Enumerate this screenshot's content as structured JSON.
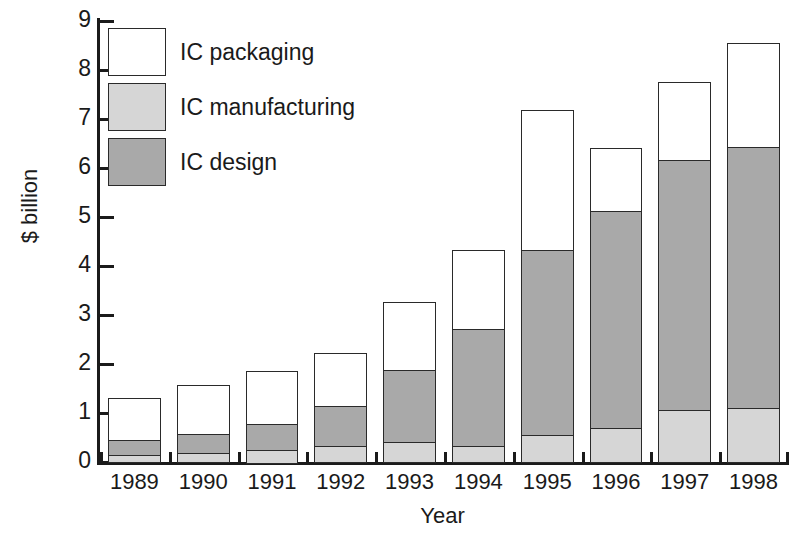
{
  "chart_data": {
    "type": "bar",
    "subtype": "stacked-bar",
    "title": "",
    "xlabel": "Year",
    "ylabel": "$ billion",
    "categories": [
      "1989",
      "1990",
      "1991",
      "1992",
      "1993",
      "1994",
      "1995",
      "1996",
      "1997",
      "1998"
    ],
    "ylim": [
      0,
      9
    ],
    "ytick_labels": [
      "0",
      "1",
      "2",
      "3",
      "4",
      "5",
      "6",
      "7",
      "8",
      "9"
    ],
    "ytick_values": [
      0,
      1,
      2,
      3,
      4,
      5,
      6,
      7,
      8,
      9
    ],
    "grid": false,
    "legend_position": "top-left",
    "stack_order_bottom_to_top": [
      "IC manufacturing",
      "IC design",
      "IC packaging"
    ],
    "series": [
      {
        "name": "IC manufacturing",
        "color": "#d6d6d6",
        "values": [
          0.15,
          0.18,
          0.25,
          0.32,
          0.4,
          0.32,
          0.55,
          0.7,
          1.07,
          1.1
        ]
      },
      {
        "name": "IC design",
        "color": "#a9a9a9",
        "values": [
          0.3,
          0.39,
          0.53,
          0.83,
          1.47,
          2.4,
          3.78,
          4.42,
          5.1,
          5.33
        ]
      },
      {
        "name": "IC packaging",
        "color": "#ffffff",
        "values": [
          0.85,
          1.01,
          1.07,
          1.08,
          1.4,
          1.6,
          2.85,
          1.28,
          1.58,
          2.12
        ]
      }
    ],
    "cumulative_tops": {
      "IC manufacturing": [
        0.15,
        0.18,
        0.25,
        0.32,
        0.4,
        0.32,
        0.55,
        0.7,
        1.07,
        1.1
      ],
      "IC design": [
        0.45,
        0.57,
        0.78,
        1.15,
        1.87,
        2.72,
        4.33,
        5.12,
        6.17,
        6.43
      ],
      "IC packaging": [
        1.3,
        1.58,
        1.85,
        2.23,
        3.27,
        4.32,
        7.18,
        6.4,
        7.75,
        8.55
      ]
    },
    "totals": [
      1.3,
      1.58,
      1.85,
      2.23,
      3.27,
      4.32,
      7.18,
      6.4,
      7.75,
      8.55
    ]
  },
  "legend": {
    "items": [
      {
        "label": "IC packaging",
        "color": "#ffffff"
      },
      {
        "label": "IC manufacturing",
        "color": "#d6d6d6"
      },
      {
        "label": "IC design",
        "color": "#a9a9a9"
      }
    ]
  },
  "axes": {
    "y_title": "$ billion",
    "x_title": "Year"
  }
}
